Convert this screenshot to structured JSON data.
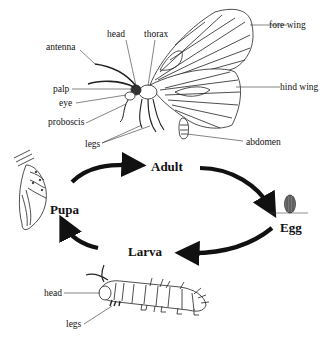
{
  "diagram": {
    "adult_parts": {
      "head": "head",
      "thorax": "thorax",
      "fore_wing": "fore wing",
      "antenna": "antenna",
      "palp": "palp",
      "eye": "eye",
      "proboscis": "proboscis",
      "legs": "legs",
      "hind_wing": "hind wing",
      "abdomen": "abdomen"
    },
    "stages": {
      "adult": "Adult",
      "egg": "Egg",
      "larva": "Larva",
      "pupa": "Pupa"
    },
    "larva_parts": {
      "head": "head",
      "legs": "legs"
    },
    "cycle_order": [
      "Adult",
      "Egg",
      "Larva",
      "Pupa"
    ],
    "colors": {
      "line": "#111111",
      "background": "#ffffff"
    }
  }
}
